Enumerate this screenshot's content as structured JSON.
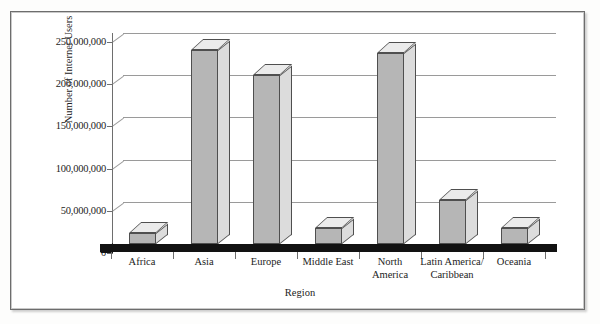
{
  "figure": {
    "frame_border_color": "#6d6d6d",
    "background": "#ffffff"
  },
  "chart_data": {
    "type": "bar",
    "title": "",
    "xlabel": "Region",
    "ylabel": "Number of Internet Users",
    "categories": [
      "Africa",
      "Asia",
      "Europe",
      "Middle East",
      "North America",
      "Latin America/ Caribbean",
      "Oceania"
    ],
    "category_lines": [
      [
        "Africa"
      ],
      [
        "Asia"
      ],
      [
        "Europe"
      ],
      [
        "Middle East"
      ],
      [
        "North",
        "America"
      ],
      [
        "Latin America/",
        "Caribbean"
      ],
      [
        "Oceania"
      ]
    ],
    "values": [
      13000000,
      230000000,
      200000000,
      19000000,
      226000000,
      52000000,
      19000000
    ],
    "ylim": [
      0,
      250000000
    ],
    "yticks": [
      0,
      50000000,
      100000000,
      150000000,
      200000000,
      250000000
    ],
    "ytick_labels": [
      "0",
      "50,000,000",
      "100,000,000",
      "150,000,000",
      "200,000,000",
      "250,000,000"
    ],
    "grid": true,
    "legend": false,
    "style": "3d-bar",
    "bar_colors": {
      "front": "#b6b6b6",
      "side": "#dcdcdc",
      "top": "#ebebeb",
      "outline": "#4f4f4f"
    },
    "floor_color": "#121212",
    "grid_color": "#9a9a9a"
  }
}
